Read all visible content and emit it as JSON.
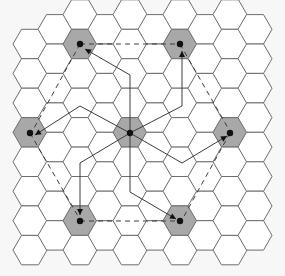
{
  "diagram": {
    "type": "hexagonal-grid",
    "hex_orientation": "flat-top",
    "hex_radius": 17,
    "origin": {
      "x": 5,
      "y": 0
    },
    "columns": 11,
    "rows": 10,
    "colors": {
      "background": "#f7f7f7",
      "hex_fill": "#ffffff",
      "hex_stroke": "#6e6e6e",
      "shaded_fill": "#a8a8a8",
      "route_stroke": "#3c3c3c",
      "node": "#111111"
    },
    "nodes": [
      {
        "id": "center",
        "x": 130,
        "y": 133
      },
      {
        "id": "top-left",
        "x": 80,
        "y": 44
      },
      {
        "id": "top-right",
        "x": 180,
        "y": 44
      },
      {
        "id": "left",
        "x": 30,
        "y": 133
      },
      {
        "id": "right",
        "x": 230,
        "y": 133
      },
      {
        "id": "bottom-left",
        "x": 80,
        "y": 221
      },
      {
        "id": "bottom-right",
        "x": 180,
        "y": 221
      }
    ],
    "solid_routes": [
      {
        "from": "center",
        "to": "top-left",
        "points": [
          [
            130,
            133
          ],
          [
            130,
            75
          ],
          [
            85,
            49
          ]
        ]
      },
      {
        "from": "center",
        "to": "top-right",
        "points": [
          [
            130,
            133
          ],
          [
            182,
            106
          ],
          [
            182,
            51
          ]
        ]
      },
      {
        "from": "center",
        "to": "left",
        "points": [
          [
            130,
            133
          ],
          [
            80,
            106
          ],
          [
            35,
            135
          ]
        ]
      },
      {
        "from": "center",
        "to": "right",
        "points": [
          [
            130,
            133
          ],
          [
            182,
            163
          ],
          [
            227,
            136
          ]
        ]
      },
      {
        "from": "center",
        "to": "bottom-left",
        "points": [
          [
            130,
            133
          ],
          [
            80,
            163
          ],
          [
            80,
            215
          ]
        ]
      },
      {
        "from": "center",
        "to": "bottom-right",
        "points": [
          [
            130,
            133
          ],
          [
            130,
            192
          ],
          [
            176,
            219
          ]
        ]
      }
    ],
    "dashed_routes": [
      {
        "from": "top-left",
        "to": "top-right",
        "points": [
          [
            80,
            44
          ],
          [
            180,
            44
          ]
        ]
      },
      {
        "from": "top-left",
        "to": "left",
        "points": [
          [
            80,
            44
          ],
          [
            33,
            130
          ]
        ]
      },
      {
        "from": "top-right",
        "to": "right",
        "points": [
          [
            180,
            44
          ],
          [
            228,
            128
          ]
        ]
      },
      {
        "from": "left",
        "to": "bottom-left",
        "points": [
          [
            30,
            133
          ],
          [
            78,
            216
          ]
        ]
      },
      {
        "from": "right",
        "to": "bottom-right",
        "points": [
          [
            230,
            133
          ],
          [
            183,
            218
          ]
        ]
      },
      {
        "from": "bottom-left",
        "to": "bottom-right",
        "points": [
          [
            80,
            221
          ],
          [
            180,
            221
          ]
        ]
      }
    ]
  }
}
